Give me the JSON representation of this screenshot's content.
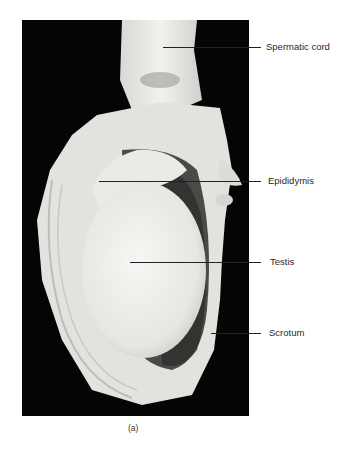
{
  "figure": {
    "caption": "(a)",
    "labels": [
      {
        "id": "spermatic-cord",
        "text": "Spermatic cord"
      },
      {
        "id": "epididymis",
        "text": "Epididymis"
      },
      {
        "id": "testis",
        "text": "Testis"
      },
      {
        "id": "scrotum",
        "text": "Scrotum"
      }
    ]
  }
}
